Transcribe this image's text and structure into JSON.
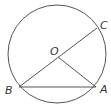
{
  "diagram": {
    "type": "circle-geometry",
    "labels": {
      "center": "O",
      "point_a": "A",
      "point_b": "B",
      "point_c": "C"
    },
    "segments": [
      "BC (diameter through O)",
      "BA (chord)",
      "OA (radius)"
    ],
    "stroke_color": "#555555"
  }
}
